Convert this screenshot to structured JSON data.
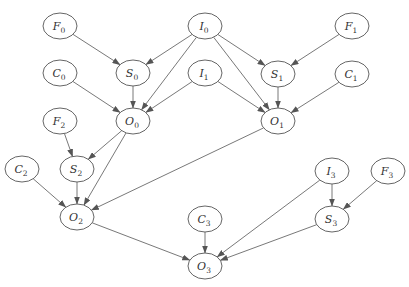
{
  "diagram": {
    "type": "directed-graph",
    "node_rx": 17,
    "node_ry": 13,
    "colors": {
      "stroke": "#555555",
      "fill": "#ffffff",
      "text": "#333333",
      "background": "#ffffff"
    },
    "nodes": [
      {
        "id": "F0",
        "letter": "F",
        "sub": "0",
        "x": 60,
        "y": 26
      },
      {
        "id": "I0",
        "letter": "I",
        "sub": "0",
        "x": 205,
        "y": 26
      },
      {
        "id": "F1",
        "letter": "F",
        "sub": "1",
        "x": 352,
        "y": 26
      },
      {
        "id": "C0",
        "letter": "C",
        "sub": "0",
        "x": 60,
        "y": 73
      },
      {
        "id": "S0",
        "letter": "S",
        "sub": "0",
        "x": 133,
        "y": 73
      },
      {
        "id": "I1",
        "letter": "I",
        "sub": "1",
        "x": 205,
        "y": 73
      },
      {
        "id": "S1",
        "letter": "S",
        "sub": "1",
        "x": 278,
        "y": 74
      },
      {
        "id": "C1",
        "letter": "C",
        "sub": "1",
        "x": 352,
        "y": 74
      },
      {
        "id": "F2",
        "letter": "F",
        "sub": "2",
        "x": 60,
        "y": 121
      },
      {
        "id": "O0",
        "letter": "O",
        "sub": "0",
        "x": 133,
        "y": 121
      },
      {
        "id": "O1",
        "letter": "O",
        "sub": "1",
        "x": 278,
        "y": 121
      },
      {
        "id": "C2",
        "letter": "C",
        "sub": "2",
        "x": 22,
        "y": 169
      },
      {
        "id": "S2",
        "letter": "S",
        "sub": "2",
        "x": 77,
        "y": 169
      },
      {
        "id": "I3",
        "letter": "I",
        "sub": "3",
        "x": 332,
        "y": 171
      },
      {
        "id": "F3",
        "letter": "F",
        "sub": "3",
        "x": 388,
        "y": 171
      },
      {
        "id": "O2",
        "letter": "O",
        "sub": "2",
        "x": 77,
        "y": 217
      },
      {
        "id": "C3",
        "letter": "C",
        "sub": "3",
        "x": 205,
        "y": 219
      },
      {
        "id": "S3",
        "letter": "S",
        "sub": "3",
        "x": 332,
        "y": 219
      },
      {
        "id": "O3",
        "letter": "O",
        "sub": "3",
        "x": 205,
        "y": 266
      }
    ],
    "edges": [
      {
        "from": "F0",
        "to": "S0"
      },
      {
        "from": "I0",
        "to": "S0"
      },
      {
        "from": "I0",
        "to": "O0"
      },
      {
        "from": "I0",
        "to": "O1"
      },
      {
        "from": "I0",
        "to": "S1"
      },
      {
        "from": "F1",
        "to": "S1"
      },
      {
        "from": "C0",
        "to": "O0"
      },
      {
        "from": "S0",
        "to": "O0"
      },
      {
        "from": "I1",
        "to": "O0"
      },
      {
        "from": "I1",
        "to": "O1"
      },
      {
        "from": "S1",
        "to": "O1"
      },
      {
        "from": "C1",
        "to": "O1"
      },
      {
        "from": "F2",
        "to": "S2"
      },
      {
        "from": "O0",
        "to": "S2"
      },
      {
        "from": "O0",
        "to": "O2"
      },
      {
        "from": "S2",
        "to": "O2"
      },
      {
        "from": "C2",
        "to": "O2"
      },
      {
        "from": "O1",
        "to": "O2"
      },
      {
        "from": "O2",
        "to": "O3"
      },
      {
        "from": "C3",
        "to": "O3"
      },
      {
        "from": "I3",
        "to": "O3"
      },
      {
        "from": "I3",
        "to": "S3"
      },
      {
        "from": "F3",
        "to": "S3"
      },
      {
        "from": "S3",
        "to": "O3"
      }
    ]
  }
}
